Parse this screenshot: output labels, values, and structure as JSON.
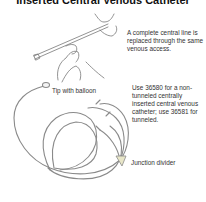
{
  "title": "Inserted Central Venous Catheter",
  "notes": {
    "replacement": "A complete central line is replaced through the same venous access.",
    "codes": "Use 36580 for a non-tunneled centrally inserted central venous catheter; use 36581 for tunneled."
  },
  "labels": {
    "tip": "Tip with balloon",
    "junction": "Junction divider"
  },
  "colors": {
    "line": "#8a8a8a",
    "junction_fill": "#e8e6c8",
    "text": "#333333"
  }
}
